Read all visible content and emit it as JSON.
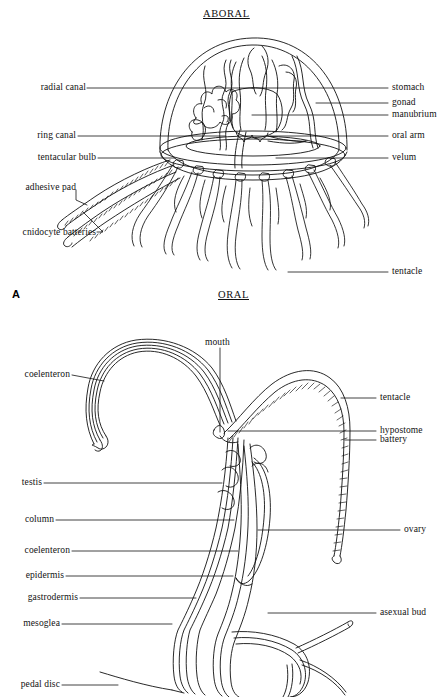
{
  "figure": {
    "background_color": "#ffffff",
    "ink_color": "#111111",
    "panels": [
      {
        "id": "A",
        "panel_letter": "A",
        "subject": "hydromedusa-jellyfish-cutaway",
        "orientation_top": "ABORAL",
        "orientation_bottom": "ORAL",
        "labels_left": [
          {
            "key": "radial-canal",
            "text": "radial canal"
          },
          {
            "key": "ring-canal",
            "text": "ring canal"
          },
          {
            "key": "tentacular-bulb",
            "text": "tentacular bulb"
          },
          {
            "key": "adhesive-pad",
            "text": "adhesive pad"
          },
          {
            "key": "cnidocyte-batteries",
            "text": "cnidocyte batteries"
          }
        ],
        "labels_right": [
          {
            "key": "stomach",
            "text": "stomach"
          },
          {
            "key": "gonad",
            "text": "gonad"
          },
          {
            "key": "manubrium",
            "text": "manubrium"
          },
          {
            "key": "oral-arm",
            "text": "oral arm"
          },
          {
            "key": "velum",
            "text": "velum"
          },
          {
            "key": "tentacle",
            "text": "tentacle"
          }
        ]
      },
      {
        "id": "B",
        "subject": "hydra-longitudinal-section",
        "labels_top": [
          {
            "key": "mouth",
            "text": "mouth"
          }
        ],
        "labels_left": [
          {
            "key": "coelenteron-tentacle",
            "text": "coelenteron"
          },
          {
            "key": "testis",
            "text": "testis"
          },
          {
            "key": "column",
            "text": "column"
          },
          {
            "key": "coelenteron-column",
            "text": "coelenteron"
          },
          {
            "key": "epidermis",
            "text": "epidermis"
          },
          {
            "key": "gastrodermis",
            "text": "gastrodermis"
          },
          {
            "key": "mesoglea",
            "text": "mesoglea"
          },
          {
            "key": "pedal-disc",
            "text": "pedal disc"
          }
        ],
        "labels_right": [
          {
            "key": "tentacle",
            "text": "tentacle"
          },
          {
            "key": "hypostome",
            "text": "hypostome"
          },
          {
            "key": "battery",
            "text": "battery"
          },
          {
            "key": "ovary",
            "text": "ovary"
          },
          {
            "key": "asexual-bud",
            "text": "asexual bud"
          }
        ]
      }
    ]
  }
}
